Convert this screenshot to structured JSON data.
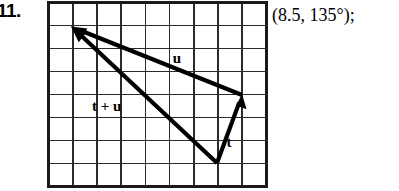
{
  "problem": {
    "number": "11.",
    "answer": "(8.5, 135°);"
  },
  "figure": {
    "caption": "vector-addition-grid-diagram",
    "grid": {
      "columns": 9,
      "rows": 8,
      "cell_width": 24.2,
      "cell_height": 23.0,
      "origin_x": 1.5,
      "origin_y": 1.5,
      "line_color": "#2b2b2b",
      "border_color": "#1a1a1a",
      "background": "#ffffff"
    },
    "vectors": [
      {
        "name": "t",
        "label": "t",
        "label_x": 182,
        "label_y": 146,
        "start_x": 170,
        "start_y": 162,
        "end_x": 195,
        "end_y": 94,
        "color": "#000000",
        "stroke_width": 4.2
      },
      {
        "name": "u",
        "label": "u",
        "label_x": 130,
        "label_y": 62,
        "start_x": 195,
        "start_y": 94,
        "end_x": 25,
        "end_y": 26,
        "color": "#000000",
        "stroke_width": 4.2
      },
      {
        "name": "t-plus-u",
        "label": "t + u",
        "label_x": 45,
        "label_y": 110,
        "start_x": 170,
        "start_y": 162,
        "end_x": 25,
        "end_y": 26,
        "color": "#000000",
        "stroke_width": 4.2
      }
    ]
  }
}
